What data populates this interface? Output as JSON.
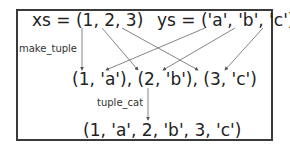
{
  "diagram": {
    "xs": "xs = (1, 2, 3)",
    "ys": "ys = ('a', 'b', 'c')",
    "make_tuple_label": "make_tuple",
    "zipped": "(1, 'a'), (2, 'b'), (3, 'c')",
    "tuple_cat_label": "tuple_cat",
    "result": "(1, 'a', 2, 'b', 3, 'c')",
    "colors": {
      "border": "#3a3a3a",
      "arrow": "#555555",
      "text": "#222222"
    }
  }
}
